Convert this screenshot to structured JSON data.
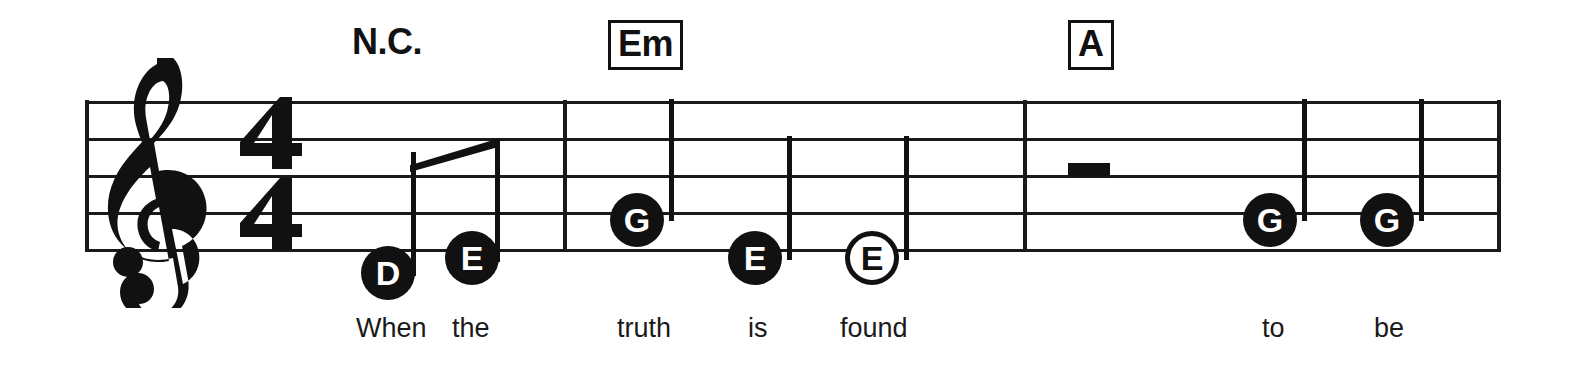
{
  "score": {
    "clef": "treble-clef",
    "time_signature": {
      "numerator": "4",
      "denominator": "4"
    },
    "staff": {
      "left": 85,
      "right": 1500,
      "line_y": [
        101,
        138,
        175,
        212,
        249
      ],
      "line_color": "#1a1a1a"
    },
    "barlines_x": [
      85,
      565,
      1025,
      1500
    ],
    "chords": [
      {
        "label": "N.C.",
        "boxed": false,
        "x": 352,
        "y": 22
      },
      {
        "label": "Em",
        "boxed": true,
        "x": 608,
        "y": 20
      },
      {
        "label": "A",
        "boxed": true,
        "x": 1068,
        "y": 20
      }
    ],
    "notes": [
      {
        "pitch": "D",
        "head": "filled",
        "x": 388,
        "y": 273,
        "stem": "up",
        "beamed": true,
        "lyric": "When"
      },
      {
        "pitch": "E",
        "head": "filled",
        "x": 472,
        "y": 258,
        "stem": "up",
        "beamed": true,
        "lyric": "the"
      },
      {
        "pitch": "G",
        "head": "filled",
        "x": 637,
        "y": 220,
        "stem": "up",
        "beamed": false,
        "lyric": "truth"
      },
      {
        "pitch": "E",
        "head": "filled",
        "x": 755,
        "y": 258,
        "stem": "up",
        "beamed": false,
        "lyric": "is"
      },
      {
        "pitch": "E",
        "head": "hollow",
        "x": 872,
        "y": 258,
        "stem": "up",
        "beamed": false,
        "lyric": "found"
      },
      {
        "pitch": "G",
        "head": "filled",
        "x": 1270,
        "y": 220,
        "stem": "up",
        "beamed": false,
        "lyric": "to"
      },
      {
        "pitch": "G",
        "head": "filled",
        "x": 1387,
        "y": 220,
        "stem": "up",
        "beamed": false,
        "lyric": "be"
      }
    ],
    "rests": [
      {
        "type": "half-rest",
        "x": 1070,
        "y": 167
      }
    ],
    "lyrics": [
      {
        "text": "When",
        "x": 356,
        "y": 313
      },
      {
        "text": "the",
        "x": 452,
        "y": 313
      },
      {
        "text": "truth",
        "x": 617,
        "y": 313
      },
      {
        "text": "is",
        "x": 748,
        "y": 313
      },
      {
        "text": "found",
        "x": 840,
        "y": 313
      },
      {
        "text": "to",
        "x": 1262,
        "y": 313
      },
      {
        "text": "be",
        "x": 1374,
        "y": 313
      }
    ]
  }
}
